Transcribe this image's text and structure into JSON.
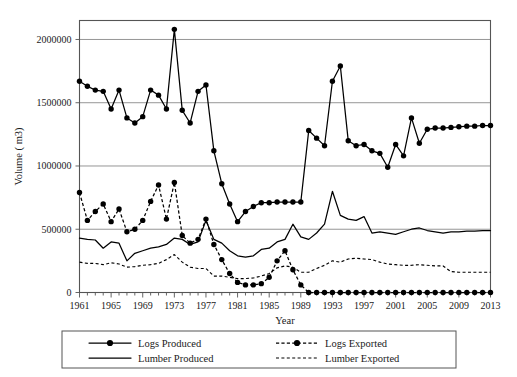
{
  "chart_data": {
    "type": "line",
    "title": "",
    "xlabel": "Year",
    "ylabel": "Volume ( m3)",
    "xlim": [
      1961,
      2013
    ],
    "ylim": [
      0,
      2150000
    ],
    "yticks": [
      0,
      500000,
      1000000,
      1500000,
      2000000
    ],
    "ytick_labels": [
      "0",
      "500000",
      "1000000",
      "1500000",
      "2000000"
    ],
    "xticks": [
      1961,
      1965,
      1969,
      1973,
      1977,
      1981,
      1985,
      1989,
      1993,
      1997,
      2001,
      2005,
      2009,
      2013
    ],
    "xtick_labels": [
      "1961",
      "1965",
      "1969",
      "1973",
      "1977",
      "1981",
      "1985",
      "1989",
      "1993",
      "1997",
      "2001",
      "2005",
      "2009",
      "2013"
    ],
    "grid": "horizontal",
    "legend_position": "bottom",
    "x": [
      1961,
      1962,
      1963,
      1964,
      1965,
      1966,
      1967,
      1968,
      1969,
      1970,
      1971,
      1972,
      1973,
      1974,
      1975,
      1976,
      1977,
      1978,
      1979,
      1980,
      1981,
      1982,
      1983,
      1984,
      1985,
      1986,
      1987,
      1988,
      1989,
      1990,
      1991,
      1992,
      1993,
      1994,
      1995,
      1996,
      1997,
      1998,
      1999,
      2000,
      2001,
      2002,
      2003,
      2004,
      2005,
      2006,
      2007,
      2008,
      2009,
      2010,
      2011,
      2012,
      2013
    ],
    "series": [
      {
        "name": "Logs Produced",
        "style": "solid-marker",
        "values": [
          1670000,
          1630000,
          1600000,
          1590000,
          1450000,
          1600000,
          1380000,
          1340000,
          1390000,
          1600000,
          1560000,
          1450000,
          2080000,
          1440000,
          1340000,
          1590000,
          1640000,
          1120000,
          860000,
          700000,
          560000,
          640000,
          680000,
          710000,
          710000,
          715000,
          715000,
          715000,
          715000,
          1280000,
          1220000,
          1160000,
          1670000,
          1790000,
          1200000,
          1160000,
          1170000,
          1120000,
          1100000,
          990000,
          1170000,
          1080000,
          1380000,
          1180000,
          1290000,
          1300000,
          1300000,
          1305000,
          1310000,
          1315000,
          1315000,
          1320000,
          1320000
        ]
      },
      {
        "name": "Logs Exported",
        "style": "dashed-marker",
        "values": [
          790000,
          570000,
          640000,
          700000,
          560000,
          660000,
          480000,
          500000,
          570000,
          720000,
          850000,
          580000,
          870000,
          450000,
          390000,
          420000,
          580000,
          380000,
          260000,
          150000,
          80000,
          60000,
          60000,
          70000,
          120000,
          250000,
          330000,
          180000,
          60000,
          0,
          0,
          0,
          0,
          0,
          0,
          0,
          0,
          0,
          0,
          0,
          0,
          0,
          0,
          0,
          0,
          0,
          0,
          0,
          0,
          0,
          0,
          0,
          0
        ]
      },
      {
        "name": "Lumber Produced",
        "style": "solid-plain",
        "values": [
          430000,
          420000,
          415000,
          350000,
          400000,
          390000,
          250000,
          310000,
          330000,
          350000,
          360000,
          380000,
          430000,
          420000,
          380000,
          400000,
          570000,
          420000,
          390000,
          330000,
          290000,
          280000,
          290000,
          340000,
          350000,
          400000,
          420000,
          540000,
          440000,
          420000,
          470000,
          540000,
          800000,
          610000,
          580000,
          570000,
          600000,
          470000,
          480000,
          470000,
          460000,
          480000,
          500000,
          510000,
          490000,
          480000,
          470000,
          480000,
          480000,
          485000,
          485000,
          490000,
          490000
        ]
      },
      {
        "name": "Lumber Exported",
        "style": "dashed-plain",
        "values": [
          240000,
          230000,
          230000,
          220000,
          235000,
          225000,
          200000,
          205000,
          215000,
          220000,
          230000,
          260000,
          300000,
          240000,
          200000,
          190000,
          190000,
          130000,
          130000,
          120000,
          110000,
          110000,
          115000,
          130000,
          150000,
          195000,
          210000,
          200000,
          160000,
          160000,
          190000,
          215000,
          250000,
          240000,
          265000,
          270000,
          265000,
          260000,
          240000,
          225000,
          220000,
          215000,
          215000,
          220000,
          215000,
          210000,
          210000,
          165000,
          160000,
          160000,
          160000,
          160000,
          160000
        ]
      }
    ]
  },
  "legend": {
    "items": [
      {
        "label": "Logs Produced",
        "style": "solid-marker"
      },
      {
        "label": "Logs Exported",
        "style": "dashed-marker"
      },
      {
        "label": "Lumber Produced",
        "style": "solid-plain"
      },
      {
        "label": "Lumber Exported",
        "style": "dashed-plain"
      }
    ]
  }
}
